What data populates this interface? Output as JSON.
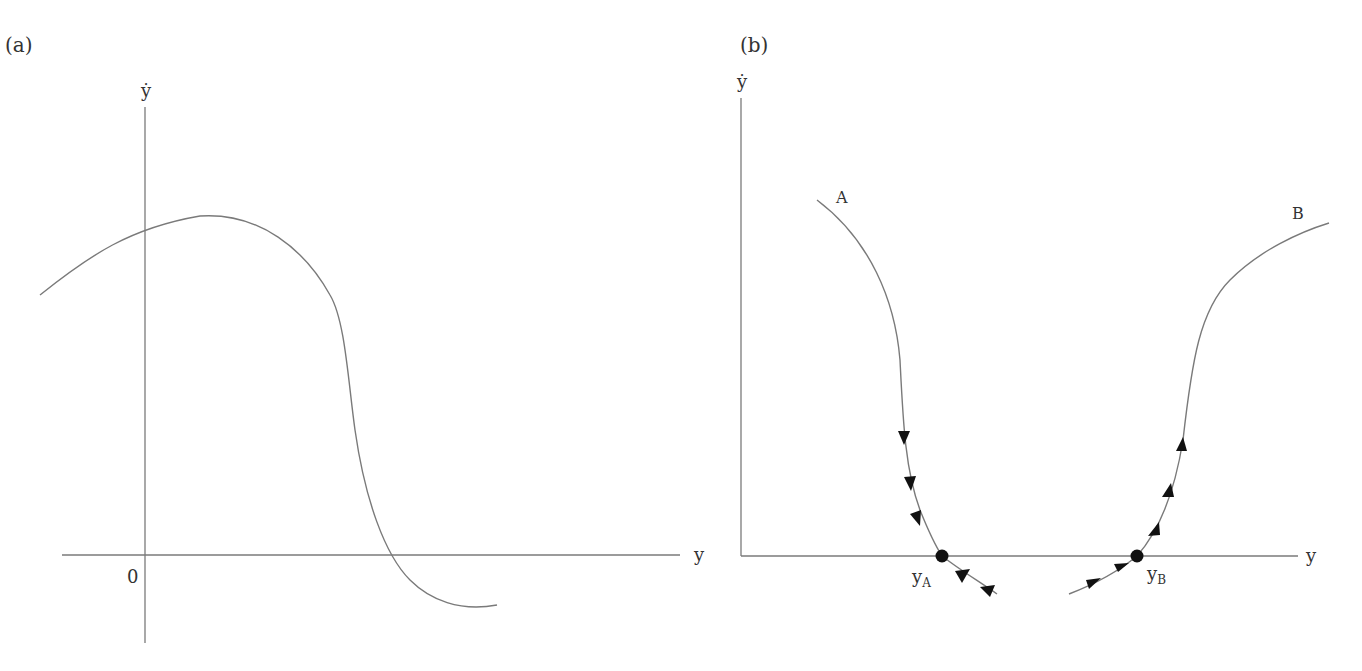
{
  "panels": [
    {
      "id": "a",
      "label": "(a)",
      "y_axis_label": "ẏ",
      "x_axis_label": "y",
      "origin_label": "0"
    },
    {
      "id": "b",
      "label": "(b)",
      "y_axis_label": "ẏ",
      "x_axis_label": "y",
      "curves": [
        {
          "name": "A",
          "fixed_point_main": "y",
          "fixed_point_sub": "A",
          "stability": "stable"
        },
        {
          "name": "B",
          "fixed_point_main": "y",
          "fixed_point_sub": "B",
          "stability": "unstable"
        }
      ]
    }
  ],
  "colors": {
    "line": "#7a7a7a",
    "marker": "#111111",
    "text": "#333333"
  }
}
